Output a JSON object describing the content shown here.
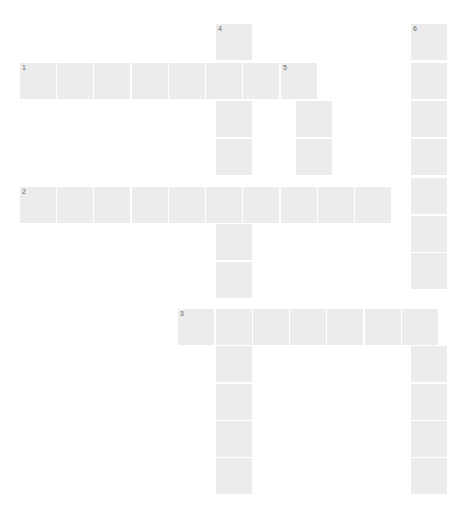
{
  "puzzle": {
    "title": "Crossword Puzzle Grid",
    "type": "crossword",
    "background_color": "#ffffff",
    "cell_fill_color": "#ececec",
    "cell_border_color": "#ffffff",
    "number_color": "#8f8f8f",
    "canvas": {
      "width": 471,
      "height": 517
    },
    "geometry": {
      "cell_size": 37.2,
      "origin_x": 19,
      "origin_y": 23,
      "columns": 12,
      "rows": 13
    },
    "entries": [
      {
        "number": "1",
        "direction": "across",
        "row": 1,
        "col": 0,
        "length": 8,
        "x": 19,
        "y": 62,
        "cells": [
          {
            "col": 0,
            "number": "1"
          },
          {
            "col": 1,
            "number": ""
          },
          {
            "col": 2,
            "number": ""
          },
          {
            "col": 3,
            "number": ""
          },
          {
            "col": 4,
            "number": ""
          },
          {
            "col": 5,
            "number": ""
          },
          {
            "col": 6,
            "number": ""
          },
          {
            "col": 7,
            "number": "5"
          }
        ]
      },
      {
        "number": "2",
        "direction": "across",
        "row": 4,
        "col": 0,
        "length": 10,
        "x": 19,
        "y": 186,
        "cells": [
          {
            "col": 0,
            "number": "2"
          },
          {
            "col": 1,
            "number": ""
          },
          {
            "col": 2,
            "number": ""
          },
          {
            "col": 3,
            "number": ""
          },
          {
            "col": 4,
            "number": ""
          },
          {
            "col": 5,
            "number": ""
          },
          {
            "col": 6,
            "number": ""
          },
          {
            "col": 7,
            "number": ""
          },
          {
            "col": 8,
            "number": ""
          },
          {
            "col": 9,
            "number": ""
          }
        ]
      },
      {
        "number": "3",
        "direction": "across",
        "row": 7,
        "col": 4,
        "length": 8,
        "x": 177,
        "y": 308,
        "cells": [
          {
            "col": 4,
            "number": "3"
          },
          {
            "col": 5,
            "number": ""
          },
          {
            "col": 6,
            "number": ""
          },
          {
            "col": 7,
            "number": ""
          },
          {
            "col": 8,
            "number": ""
          },
          {
            "col": 9,
            "number": ""
          },
          {
            "col": 10,
            "number": ""
          },
          {
            "col": 11,
            "number": ""
          }
        ]
      },
      {
        "number": "4",
        "direction": "down",
        "row": 0,
        "col": 5,
        "length": 13,
        "x": 215,
        "y": 23,
        "cells": [
          {
            "row": 0,
            "number": "4"
          },
          {
            "row": 1,
            "number": ""
          },
          {
            "row": 2,
            "number": ""
          },
          {
            "row": 3,
            "number": ""
          },
          {
            "row": 4,
            "number": ""
          },
          {
            "row": 5,
            "number": ""
          },
          {
            "row": 6,
            "number": ""
          },
          {
            "row": 7,
            "number": ""
          },
          {
            "row": 8,
            "number": ""
          },
          {
            "row": 9,
            "number": ""
          },
          {
            "row": 10,
            "number": ""
          },
          {
            "row": 11,
            "number": ""
          },
          {
            "row": 12,
            "number": ""
          }
        ]
      },
      {
        "number": "5",
        "direction": "down",
        "row": 1,
        "col": 7,
        "length": 4,
        "x": 295,
        "y": 62,
        "cells": [
          {
            "row": 1,
            "number": "5"
          },
          {
            "row": 2,
            "number": ""
          },
          {
            "row": 3,
            "number": ""
          },
          {
            "row": 4,
            "number": ""
          }
        ]
      },
      {
        "number": "6",
        "direction": "down",
        "row": 0,
        "col": 11,
        "length": 13,
        "x": 410,
        "y": 23,
        "cells": [
          {
            "row": 0,
            "number": "6"
          },
          {
            "row": 1,
            "number": ""
          },
          {
            "row": 2,
            "number": ""
          },
          {
            "row": 3,
            "number": ""
          },
          {
            "row": 4,
            "number": ""
          },
          {
            "row": 5,
            "number": ""
          },
          {
            "row": 6,
            "number": ""
          },
          {
            "row": 7,
            "number": ""
          },
          {
            "row": 8,
            "number": ""
          },
          {
            "row": 9,
            "number": ""
          },
          {
            "row": 10,
            "number": ""
          },
          {
            "row": 11,
            "number": ""
          },
          {
            "row": 12,
            "number": ""
          }
        ]
      }
    ],
    "grid_cells": [
      {
        "x": 19,
        "y": 62,
        "w": 38,
        "h": 38,
        "number": "1"
      },
      {
        "x": 56,
        "y": 62,
        "w": 38,
        "h": 38,
        "number": ""
      },
      {
        "x": 93,
        "y": 62,
        "w": 38,
        "h": 38,
        "number": ""
      },
      {
        "x": 131,
        "y": 62,
        "w": 38,
        "h": 38,
        "number": ""
      },
      {
        "x": 168,
        "y": 62,
        "w": 38,
        "h": 38,
        "number": ""
      },
      {
        "x": 205,
        "y": 62,
        "w": 38,
        "h": 38,
        "number": ""
      },
      {
        "x": 242,
        "y": 62,
        "w": 38,
        "h": 38,
        "number": ""
      },
      {
        "x": 280,
        "y": 62,
        "w": 38,
        "h": 38,
        "number": "5"
      },
      {
        "x": 19,
        "y": 186,
        "w": 38,
        "h": 38,
        "number": "2"
      },
      {
        "x": 56,
        "y": 186,
        "w": 38,
        "h": 38,
        "number": ""
      },
      {
        "x": 93,
        "y": 186,
        "w": 38,
        "h": 38,
        "number": ""
      },
      {
        "x": 131,
        "y": 186,
        "w": 38,
        "h": 38,
        "number": ""
      },
      {
        "x": 168,
        "y": 186,
        "w": 38,
        "h": 38,
        "number": ""
      },
      {
        "x": 205,
        "y": 186,
        "w": 38,
        "h": 38,
        "number": ""
      },
      {
        "x": 242,
        "y": 186,
        "w": 38,
        "h": 38,
        "number": ""
      },
      {
        "x": 280,
        "y": 186,
        "w": 38,
        "h": 38,
        "number": ""
      },
      {
        "x": 317,
        "y": 186,
        "w": 38,
        "h": 38,
        "number": ""
      },
      {
        "x": 354,
        "y": 186,
        "w": 38,
        "h": 38,
        "number": ""
      },
      {
        "x": 177,
        "y": 308,
        "w": 38,
        "h": 38,
        "number": "3"
      },
      {
        "x": 215,
        "y": 308,
        "w": 38,
        "h": 38,
        "number": ""
      },
      {
        "x": 252,
        "y": 308,
        "w": 38,
        "h": 38,
        "number": ""
      },
      {
        "x": 289,
        "y": 308,
        "w": 38,
        "h": 38,
        "number": ""
      },
      {
        "x": 326,
        "y": 308,
        "w": 38,
        "h": 38,
        "number": ""
      },
      {
        "x": 364,
        "y": 308,
        "w": 38,
        "h": 38,
        "number": ""
      },
      {
        "x": 401,
        "y": 308,
        "w": 38,
        "h": 38,
        "number": ""
      },
      {
        "x": 215,
        "y": 23,
        "w": 38,
        "h": 38,
        "number": "4"
      },
      {
        "x": 215,
        "y": 100,
        "w": 38,
        "h": 38,
        "number": ""
      },
      {
        "x": 215,
        "y": 138,
        "w": 38,
        "h": 38,
        "number": ""
      },
      {
        "x": 215,
        "y": 223,
        "w": 38,
        "h": 38,
        "number": ""
      },
      {
        "x": 215,
        "y": 261,
        "w": 38,
        "h": 38,
        "number": ""
      },
      {
        "x": 215,
        "y": 345,
        "w": 38,
        "h": 38,
        "number": ""
      },
      {
        "x": 215,
        "y": 383,
        "w": 38,
        "h": 38,
        "number": ""
      },
      {
        "x": 215,
        "y": 420,
        "w": 38,
        "h": 38,
        "number": ""
      },
      {
        "x": 215,
        "y": 457,
        "w": 38,
        "h": 38,
        "number": ""
      },
      {
        "x": 295,
        "y": 100,
        "w": 38,
        "h": 38,
        "number": ""
      },
      {
        "x": 295,
        "y": 138,
        "w": 38,
        "h": 38,
        "number": ""
      },
      {
        "x": 410,
        "y": 23,
        "w": 38,
        "h": 38,
        "number": "6"
      },
      {
        "x": 410,
        "y": 62,
        "w": 38,
        "h": 38,
        "number": ""
      },
      {
        "x": 410,
        "y": 100,
        "w": 38,
        "h": 38,
        "number": ""
      },
      {
        "x": 410,
        "y": 138,
        "w": 38,
        "h": 38,
        "number": ""
      },
      {
        "x": 410,
        "y": 177,
        "w": 38,
        "h": 38,
        "number": ""
      },
      {
        "x": 410,
        "y": 215,
        "w": 38,
        "h": 38,
        "number": ""
      },
      {
        "x": 410,
        "y": 252,
        "w": 38,
        "h": 38,
        "number": ""
      },
      {
        "x": 410,
        "y": 345,
        "w": 38,
        "h": 38,
        "number": ""
      },
      {
        "x": 410,
        "y": 383,
        "w": 38,
        "h": 38,
        "number": ""
      },
      {
        "x": 410,
        "y": 420,
        "w": 38,
        "h": 38,
        "number": ""
      },
      {
        "x": 410,
        "y": 457,
        "w": 38,
        "h": 38,
        "number": ""
      }
    ]
  }
}
